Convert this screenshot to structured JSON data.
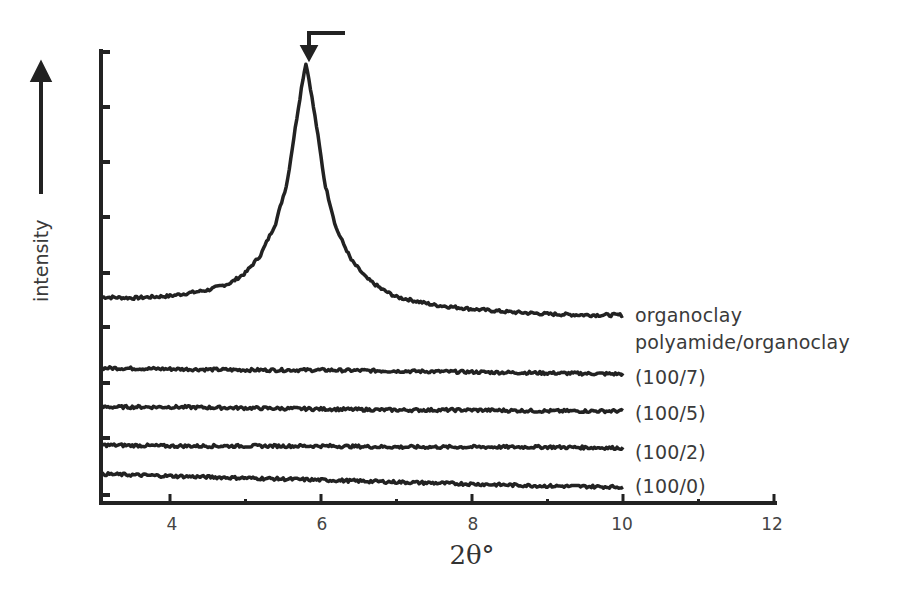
{
  "chart_data": {
    "type": "line",
    "title": "",
    "xlabel": "2θ°",
    "ylabel": "intensity",
    "xlim": [
      3.07,
      12
    ],
    "x_ticks": [
      4,
      6,
      8,
      10,
      12
    ],
    "x_tick_labels": [
      "4",
      "6",
      "8",
      "10",
      "12"
    ],
    "y_ticks_unlabeled": true,
    "grid": false,
    "legend_position": "inline-right",
    "peak_marker": {
      "x": 5.8,
      "description": "arrow pointing to peak maximum"
    },
    "series": [
      {
        "name": "organoclay",
        "x": [
          3.1,
          3.5,
          4.0,
          4.5,
          4.8,
          5.0,
          5.2,
          5.4,
          5.55,
          5.65,
          5.75,
          5.8,
          5.85,
          5.95,
          6.05,
          6.2,
          6.4,
          6.6,
          6.8,
          7.0,
          7.5,
          8.0,
          8.5,
          9.0,
          9.5,
          10.0
        ],
        "y": [
          206,
          205,
          207,
          213,
          220,
          230,
          248,
          280,
          320,
          370,
          420,
          440,
          420,
          372,
          320,
          275,
          243,
          225,
          214,
          206,
          198,
          194,
          191,
          189,
          188,
          188
        ]
      },
      {
        "name": "polyamide/organoclay (100/7)",
        "x": [
          3.1,
          4,
          5,
          6,
          7,
          8,
          9,
          10
        ],
        "y": [
          135,
          134,
          133,
          133,
          132,
          131,
          130,
          129
        ]
      },
      {
        "name": "polyamide/organoclay (100/5)",
        "x": [
          3.1,
          4,
          5,
          6,
          7,
          8,
          9,
          10
        ],
        "y": [
          96,
          96,
          95,
          94,
          93,
          93,
          92,
          92
        ]
      },
      {
        "name": "polyamide/organoclay (100/2)",
        "x": [
          3.1,
          4,
          5,
          6,
          7,
          8,
          9,
          10
        ],
        "y": [
          58,
          57,
          57,
          57,
          56,
          56,
          56,
          55
        ]
      },
      {
        "name": "polyamide/organoclay (100/0)",
        "x": [
          3.1,
          4,
          5,
          6,
          7,
          8,
          9,
          10
        ],
        "y": [
          29,
          27,
          25,
          23,
          21,
          19,
          17,
          16
        ]
      }
    ]
  },
  "labels": {
    "organoclay": "organoclay",
    "group": "polyamide/organoclay",
    "s1007": "(100/7)",
    "s1005": "(100/5)",
    "s1002": "(100/2)",
    "s1000": "(100/0)"
  },
  "axes": {
    "xlabel": "2θ°",
    "ylabel": "intensity",
    "ticks": [
      "4",
      "6",
      "8",
      "10",
      "12"
    ]
  },
  "colors": {
    "line": "#222222",
    "text": "#3a3a3a"
  }
}
